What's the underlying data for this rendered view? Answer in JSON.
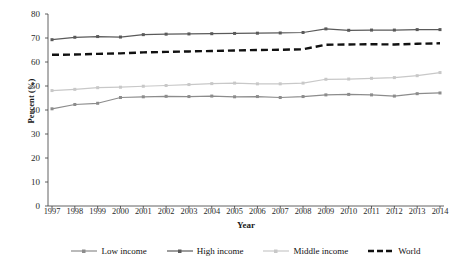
{
  "chart_data": {
    "type": "line",
    "title": "",
    "xlabel": "Year",
    "ylabel": "Percent (%)",
    "ylim": [
      0,
      80
    ],
    "ytick_step": 10,
    "yticks": [
      80,
      70,
      60,
      50,
      40,
      30,
      20,
      10,
      0
    ],
    "grid": false,
    "legend_position": "bottom",
    "categories": [
      "1997",
      "1998",
      "1999",
      "2000",
      "2001",
      "2002",
      "2003",
      "2004",
      "2005",
      "2006",
      "2007",
      "2008",
      "2009",
      "2010",
      "2011",
      "2012",
      "2013",
      "2014"
    ],
    "series": [
      {
        "name": "Low income",
        "color": "#8c8c8c",
        "style": "solid",
        "marker": "square",
        "values": [
          40.5,
          42.3,
          42.8,
          45.2,
          45.5,
          45.7,
          45.6,
          45.8,
          45.5,
          45.6,
          45.2,
          45.6,
          46.3,
          46.5,
          46.3,
          45.8,
          46.8,
          47.1
        ]
      },
      {
        "name": "High income",
        "color": "#5a5a5a",
        "style": "solid",
        "marker": "square",
        "values": [
          69.3,
          70.3,
          70.6,
          70.4,
          71.4,
          71.6,
          71.7,
          71.8,
          71.9,
          72.0,
          72.1,
          72.3,
          73.8,
          73.2,
          73.3,
          73.3,
          73.5,
          73.5
        ]
      },
      {
        "name": "Middle income",
        "color": "#c8c8c8",
        "style": "solid",
        "marker": "square",
        "values": [
          48.1,
          48.6,
          49.3,
          49.5,
          49.9,
          50.2,
          50.6,
          51.0,
          51.2,
          50.9,
          50.9,
          51.2,
          52.8,
          52.9,
          53.2,
          53.5,
          54.3,
          55.6
        ]
      },
      {
        "name": "World",
        "color": "#111111",
        "style": "dashed",
        "marker": "none",
        "values": [
          63.0,
          63.1,
          63.4,
          63.6,
          64.0,
          64.2,
          64.4,
          64.6,
          64.8,
          65.0,
          65.1,
          65.3,
          67.2,
          67.3,
          67.4,
          67.3,
          67.6,
          67.8
        ]
      }
    ]
  },
  "axes": {
    "y_title": "Percent (%)",
    "x_title": "Year"
  },
  "legend": {
    "items": [
      {
        "label": "Low income"
      },
      {
        "label": "High income"
      },
      {
        "label": "Middle income"
      },
      {
        "label": "World"
      }
    ]
  }
}
